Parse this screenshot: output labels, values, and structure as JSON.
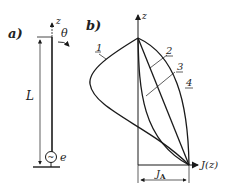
{
  "panel_a": {
    "label": "a)",
    "axis_label": "z",
    "angle_label": "θ",
    "length_label": "L",
    "source_label": "e",
    "source_symbol": "~"
  },
  "panel_b": {
    "label": "b)",
    "y_axis_label": "z",
    "x_axis_label": "J(z)",
    "dimension_label": "J",
    "dimension_subscript": "A",
    "curves": [
      {
        "id": "1",
        "label": "1"
      },
      {
        "id": "2",
        "label": "2"
      },
      {
        "id": "3",
        "label": "3"
      },
      {
        "id": "4",
        "label": "4"
      }
    ]
  },
  "colors": {
    "line": "#1a1a1a",
    "background": "#ffffff"
  }
}
